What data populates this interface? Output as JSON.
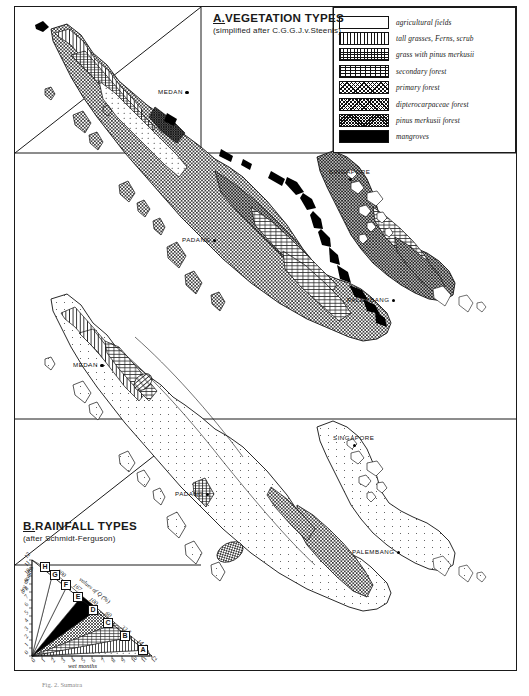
{
  "figure": {
    "caption": "Fig. 2.  Sumatra",
    "background": "#ffffff",
    "ink": "#1a1a1a"
  },
  "panel_a": {
    "letter": "A.",
    "title": "VEGETATION TYPES",
    "subtitle": "(simplified after  C.G.G.J.v.Steenis)",
    "legend": [
      {
        "pattern": "p-dots",
        "label": "agricultural fields"
      },
      {
        "pattern": "p-vlines",
        "label": "tall grasses, Ferns, scrub"
      },
      {
        "pattern": "p-vbrick",
        "label": "grass with pinus merkusii"
      },
      {
        "pattern": "p-hbrick",
        "label": "secondary forest"
      },
      {
        "pattern": "p-xhatch",
        "label": "primary forest"
      },
      {
        "pattern": "p-xhdot",
        "label": "dipterocarpaceae  forest"
      },
      {
        "pattern": "p-xhdense",
        "label": "pinus merkusii forest"
      },
      {
        "pattern": "p-solid",
        "label": "mangroves"
      }
    ],
    "cities": [
      {
        "name": "MEDAN",
        "side": "left",
        "x": 158,
        "y": 88
      },
      {
        "name": "SINGAPORE",
        "side": "top",
        "x": 329,
        "y": 168
      },
      {
        "name": "PADANG",
        "side": "left",
        "x": 182,
        "y": 236
      },
      {
        "name": "PALEMBANG",
        "side": "left",
        "x": 347,
        "y": 296
      }
    ]
  },
  "panel_b": {
    "letter": "B.",
    "title": "RAINFALL TYPES",
    "subtitle": "(after  Schmidt-Ferguson)",
    "cities": [
      {
        "name": "MEDAN",
        "side": "left",
        "x": 73,
        "y": 361
      },
      {
        "name": "SINGAPORE",
        "side": "top",
        "x": 333,
        "y": 434
      },
      {
        "name": "PADANG",
        "side": "left",
        "x": 175,
        "y": 490
      },
      {
        "name": "PALEMBANG",
        "side": "left",
        "x": 352,
        "y": 548
      }
    ]
  },
  "chart_data": {
    "type": "scatter",
    "title": "RAINFALL TYPES",
    "subtitle": "(after Schmidt-Ferguson)",
    "xlabel": "wet months",
    "ylabel": "dry months",
    "xlim": [
      0,
      12
    ],
    "ylim": [
      0,
      12
    ],
    "xticks": [
      0,
      1,
      2,
      3,
      4,
      5,
      6,
      7,
      8,
      9,
      10,
      11,
      12
    ],
    "yticks": [
      0,
      1,
      2,
      3,
      4,
      5,
      6,
      7,
      8,
      9,
      10,
      11,
      12
    ],
    "grid": false,
    "diagonal_axis_label": "values of Q (%)",
    "q_values": [
      "300",
      "167",
      "100",
      "60",
      "33.3",
      "14.3"
    ],
    "zones": [
      {
        "label": "A",
        "q_range": "0 - 14.3",
        "fill": "p-sparse"
      },
      {
        "label": "B",
        "q_range": "14.3 - 33.3",
        "fill": "p-vlines"
      },
      {
        "label": "C",
        "q_range": "33.3 - 60",
        "fill": "p-hbrick"
      },
      {
        "label": "D",
        "q_range": "60 - 100",
        "fill": "p-xhatch"
      },
      {
        "label": "E",
        "q_range": "100 - 167",
        "fill": "p-solid"
      },
      {
        "label": "F",
        "q_range": "167 - 300",
        "fill": "none"
      },
      {
        "label": "G",
        "q_range": "300 - 700",
        "fill": "none"
      },
      {
        "label": "H",
        "q_range": "> 700",
        "fill": "none"
      }
    ]
  }
}
